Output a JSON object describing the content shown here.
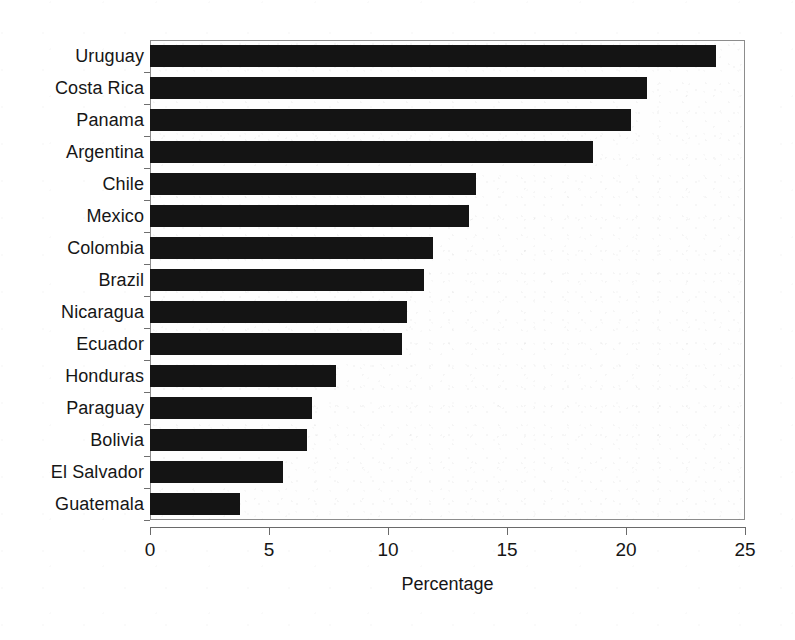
{
  "chart_data": {
    "type": "bar",
    "orientation": "horizontal",
    "title": "",
    "xlabel": "Percentage",
    "ylabel": "",
    "xlim": [
      0,
      25
    ],
    "xticks": [
      0,
      5,
      10,
      15,
      20,
      25
    ],
    "xtick_labels": [
      "0",
      "5",
      "10",
      "15",
      "20",
      "25"
    ],
    "grid": false,
    "legend": null,
    "bar_color": "#141414",
    "categories": [
      "Uruguay",
      "Costa Rica",
      "Panama",
      "Argentina",
      "Chile",
      "Mexico",
      "Colombia",
      "Brazil",
      "Nicaragua",
      "Ecuador",
      "Honduras",
      "Paraguay",
      "Bolivia",
      "El Salvador",
      "Guatemala"
    ],
    "values": [
      23.8,
      20.9,
      20.2,
      18.6,
      13.7,
      13.4,
      11.9,
      11.5,
      10.8,
      10.6,
      7.8,
      6.8,
      6.6,
      5.6,
      3.8
    ]
  }
}
